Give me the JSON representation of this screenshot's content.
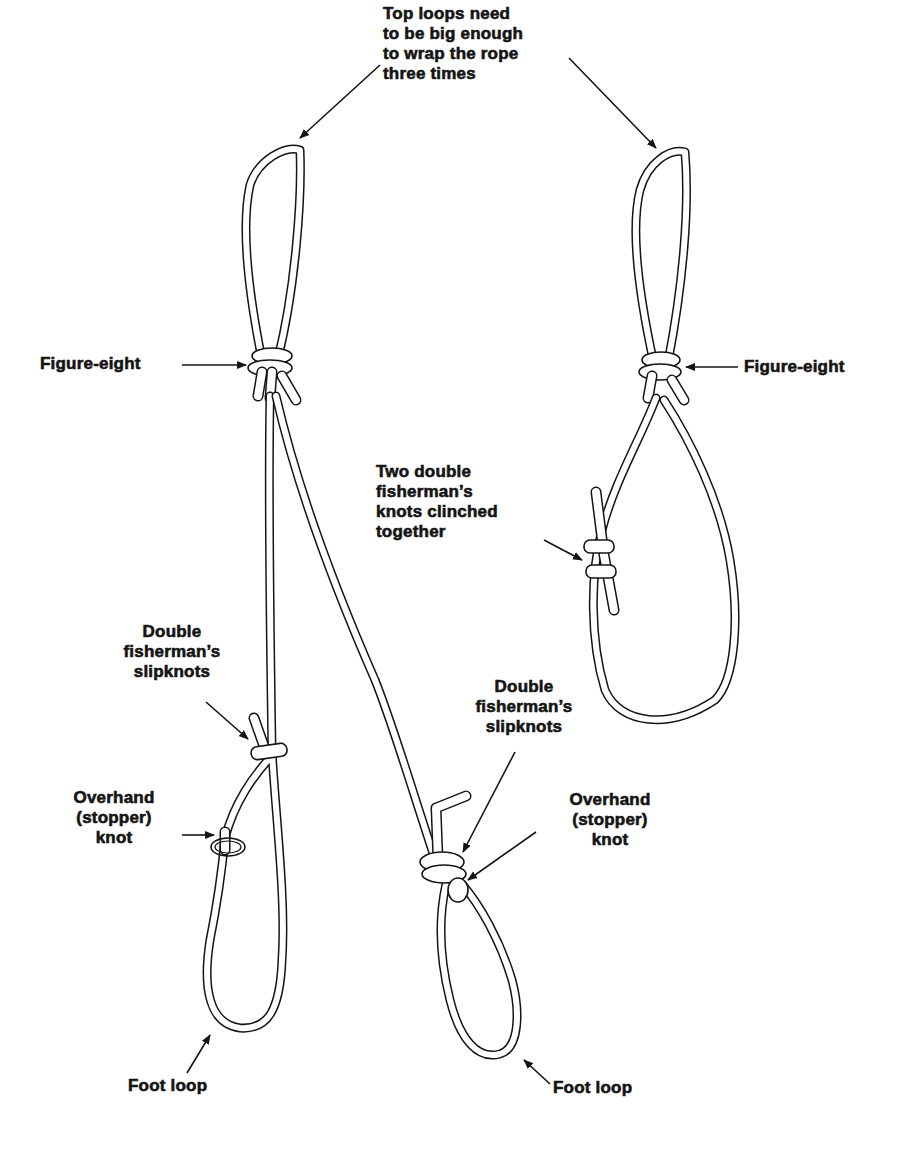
{
  "diagram": {
    "labels": {
      "top_loops": [
        "Top loops need",
        "to be big enough",
        "to wrap the rope",
        "three times"
      ],
      "figure_eight_left": [
        "Figure-eight"
      ],
      "figure_eight_right": [
        "Figure-eight"
      ],
      "two_double_fisherman": [
        "Two double",
        "fisherman’s",
        "knots clinched",
        "together"
      ],
      "double_fisherman_slipknots_left": [
        "Double",
        "fisherman’s",
        "slipknots"
      ],
      "double_fisherman_slipknots_right": [
        "Double",
        "fisherman’s",
        "slipknots"
      ],
      "overhand_stopper_left": [
        "Overhand",
        "(stopper)",
        "knot"
      ],
      "overhand_stopper_right": [
        "Overhand",
        "(stopper)",
        "knot"
      ],
      "foot_loop_left": [
        "Foot loop"
      ],
      "foot_loop_right": [
        "Foot loop"
      ]
    },
    "components": [
      {
        "name": "left-top-loop",
        "knot": "Figure-eight"
      },
      {
        "name": "right-top-loop",
        "knot": "Figure-eight"
      },
      {
        "name": "right-sling",
        "knot": "Two double fisherman's knots clinched together"
      },
      {
        "name": "left-foot-loop",
        "knots": [
          "Double fisherman's slipknots",
          "Overhand (stopper) knot"
        ]
      },
      {
        "name": "right-foot-loop",
        "knots": [
          "Double fisherman's slipknots",
          "Overhand (stopper) knot"
        ]
      }
    ],
    "colors": {
      "ink": "#141414",
      "paper": "#ffffff"
    }
  }
}
